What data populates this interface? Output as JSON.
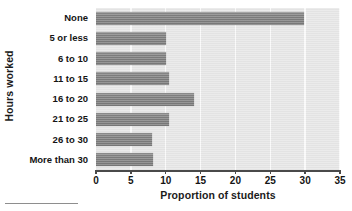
{
  "chart_data": {
    "type": "bar",
    "orientation": "horizontal",
    "title": "",
    "xlabel": "Proportion of students",
    "ylabel": "Hours worked",
    "categories": [
      "None",
      "5 or less",
      "6 to 10",
      "11 to 15",
      "16 to 20",
      "21 to 25",
      "26 to 30",
      "More than 30"
    ],
    "values": [
      29.8,
      10.0,
      10.0,
      10.4,
      14.0,
      10.4,
      8.1,
      8.2
    ],
    "xlim": [
      0,
      35
    ],
    "xticks": [
      0,
      5,
      10,
      15,
      20,
      25,
      30,
      35
    ],
    "xtick_labels": [
      "0",
      "5",
      "10",
      "15",
      "20",
      "25",
      "30",
      "35"
    ],
    "grid": "vertical-only",
    "legend": "none",
    "series": [
      {
        "name": "Proportion of students",
        "values": [
          29.8,
          10.0,
          10.0,
          10.4,
          14.0,
          10.4,
          8.1,
          8.2
        ]
      }
    ]
  },
  "style": {
    "bar_color": "#7d7d7d",
    "plot_background": "#e6e6e6",
    "gridline_color": "#fafafa",
    "axis_color": "#4a4a4a",
    "text_color": "#141414",
    "figure_background": "#ffffff"
  }
}
